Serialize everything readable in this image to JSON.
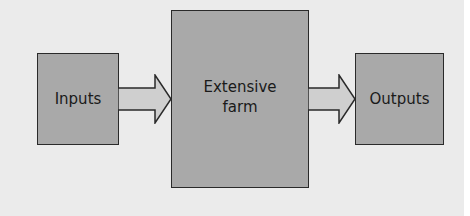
{
  "diagram": {
    "nodes": [
      {
        "id": "inputs",
        "label": "Inputs"
      },
      {
        "id": "farm",
        "label": "Extensive farm",
        "line1": "Extensive",
        "line2": "farm"
      },
      {
        "id": "outputs",
        "label": "Outputs"
      }
    ],
    "edges": [
      {
        "from": "inputs",
        "to": "farm"
      },
      {
        "from": "farm",
        "to": "outputs"
      }
    ],
    "colors": {
      "background": "#ebebeb",
      "box_fill": "#a9a9a9",
      "arrow_fill": "#cfcfcf",
      "stroke": "#2a2a2a"
    }
  }
}
